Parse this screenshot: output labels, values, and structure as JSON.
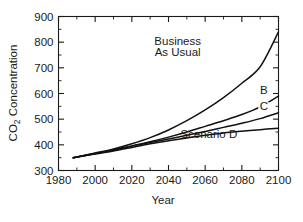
{
  "chart_data": {
    "type": "line",
    "title": "",
    "xlabel": "Year",
    "ylabel": "CO2 Concentration",
    "ylabel_prefix": "CO",
    "ylabel_subscript": "2",
    "ylabel_suffix": " Concentration",
    "xlim": [
      1980,
      2100
    ],
    "ylim": [
      300,
      900
    ],
    "x_major_ticks": [
      1980,
      2000,
      2020,
      2040,
      2060,
      2080,
      2100
    ],
    "x_minor_ticks": [
      1990,
      2010,
      2030,
      2050,
      2070,
      2090
    ],
    "y_major_ticks": [
      300,
      400,
      500,
      600,
      700,
      800,
      900
    ],
    "y_minor_ticks": [
      350,
      450,
      550,
      650,
      750,
      850
    ],
    "x_tick_labels": [
      "1980",
      "2000",
      "2020",
      "2040",
      "2060",
      "2080",
      "2100"
    ],
    "y_tick_labels": [
      "300",
      "400",
      "500",
      "600",
      "700",
      "800",
      "900"
    ],
    "grid": false,
    "legend_position": "inline-annotations",
    "frame": "box",
    "line_color": "#111111",
    "series": [
      {
        "name": "Business As Usual",
        "label": "Business As Usual",
        "label_line1": "Business",
        "label_line2": "As Usual",
        "x": [
          1988,
          2000,
          2010,
          2020,
          2030,
          2040,
          2050,
          2060,
          2070,
          2080,
          2090,
          2100
        ],
        "values": [
          350,
          368,
          384,
          404,
          428,
          458,
          494,
          536,
          584,
          640,
          704,
          840
        ]
      },
      {
        "name": "B",
        "label": "B",
        "x": [
          1988,
          2000,
          2010,
          2020,
          2030,
          2040,
          2050,
          2060,
          2070,
          2080,
          2090,
          2100
        ],
        "values": [
          350,
          366,
          380,
          396,
          412,
          430,
          450,
          472,
          494,
          518,
          548,
          590
        ]
      },
      {
        "name": "C",
        "label": "C",
        "x": [
          1988,
          2000,
          2010,
          2020,
          2030,
          2040,
          2050,
          2060,
          2070,
          2080,
          2090,
          2100
        ],
        "values": [
          350,
          366,
          380,
          395,
          409,
          423,
          437,
          452,
          468,
          484,
          502,
          525
        ]
      },
      {
        "name": "Scenario D",
        "label": "Scenario D",
        "x": [
          1988,
          2000,
          2010,
          2020,
          2030,
          2040,
          2050,
          2060,
          2070,
          2080,
          2090,
          2100
        ],
        "values": [
          350,
          364,
          376,
          390,
          404,
          416,
          427,
          437,
          446,
          453,
          459,
          465
        ]
      }
    ],
    "annotations": [
      {
        "text": "Business",
        "x": 2045,
        "y": 790
      },
      {
        "text": "As Usual",
        "x": 2045,
        "y": 745
      },
      {
        "text": "B",
        "x": 2092,
        "y": 600
      },
      {
        "text": "C",
        "x": 2092,
        "y": 535
      },
      {
        "text": "Scenario D",
        "x": 2062,
        "y": 425
      }
    ]
  }
}
